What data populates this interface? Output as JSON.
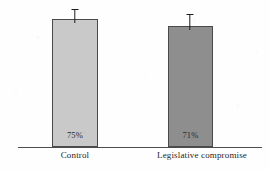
{
  "figure": {
    "background_color": "#fefefe",
    "axis_color": "#4d4d4d",
    "error_bar_color": "#1c1c1c",
    "width": 270,
    "height": 170
  },
  "chart_data": {
    "type": "bar",
    "title": "",
    "subtitle": "",
    "xlabel": "",
    "ylabel": "",
    "ylim": [
      0,
      100
    ],
    "grid": false,
    "legend": false,
    "legend_position": "none",
    "orientation": "vertical",
    "categories": [
      "Control",
      "Legislative compromise"
    ],
    "values": [
      75,
      71
    ],
    "value_labels": [
      "75%",
      "71%"
    ],
    "bar_colors": [
      "#c9c9c9",
      "#8e8e8e"
    ],
    "bar_edge_color": "#4a4a4a",
    "error_bars": {
      "shown": true,
      "style": "upper-cap",
      "upper": [
        9,
        8
      ]
    },
    "annotations": []
  },
  "bars": [
    {
      "name": "control",
      "label": "Control",
      "value_label": "75%",
      "color": "#c9c9c9",
      "geometry": {
        "left": 52,
        "width": 46,
        "top": 19,
        "bottom": 147
      },
      "error": {
        "cap_top": 9,
        "cap_width": 7,
        "center": 75
      },
      "label_geometry": {
        "left": 37,
        "width": 76,
        "top": 150
      }
    },
    {
      "name": "legislative-compromise",
      "label": "Legislative compromise",
      "value_label": "71%",
      "color": "#8e8e8e",
      "geometry": {
        "left": 168,
        "width": 45,
        "top": 26,
        "bottom": 147
      },
      "error": {
        "cap_top": 14,
        "cap_width": 7,
        "center": 190
      },
      "label_geometry": {
        "left": 143,
        "width": 118,
        "top": 150
      }
    }
  ],
  "axis": {
    "baseline": {
      "left": 18,
      "width": 244,
      "top": 147
    }
  }
}
